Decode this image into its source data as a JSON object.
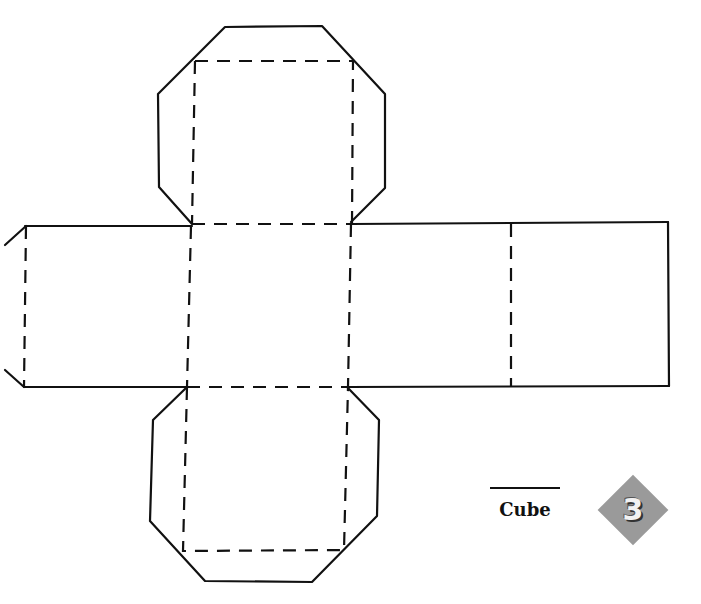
{
  "diagram": {
    "type": "cube net (paper folding template)",
    "faces": 6,
    "layout": "cross: row of four squares with one square above and one below the second square",
    "tabs": [
      "top octagonal flap",
      "bottom octagonal flap",
      "left partial tab"
    ],
    "line_styles": {
      "cut": "solid",
      "fold": "dashed"
    },
    "colors": {
      "line": "#111111",
      "badge": "#9a9a9a",
      "badge_text": "#f2f2f2",
      "background": "#ffffff"
    }
  },
  "label": {
    "title": "Cube",
    "badge_number": "3"
  }
}
